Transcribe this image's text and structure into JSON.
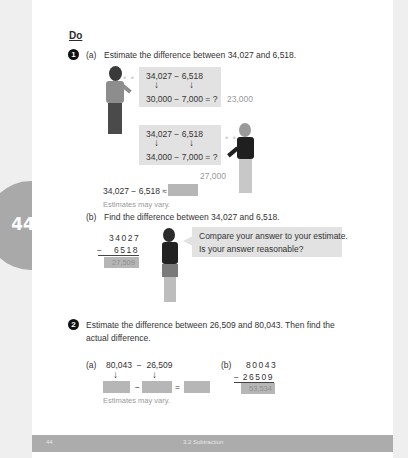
{
  "page": {
    "side_tab_number": "44",
    "heading": "Do",
    "footer": {
      "page_number": "44",
      "section": "3.2 Subtraction"
    }
  },
  "q1": {
    "number": "1",
    "a": {
      "label": "(a)",
      "prompt": "Estimate the difference between 34,027 and 6,518.",
      "boy": {
        "line1": "34,027 − 6,518",
        "arrows": [
          "↓",
          "↓"
        ],
        "line2": "30,000 − 7,000 = ?",
        "answer": "23,000"
      },
      "girl": {
        "line1": "34,027 − 6,518",
        "arrows": [
          "↓",
          "↓"
        ],
        "line2": "34,000 − 7,000 = ?",
        "answer": "27,000"
      },
      "estimate_line": "34,027 − 6,518 ≈",
      "note": "Estimates may vary."
    },
    "b": {
      "label": "(b)",
      "prompt": "Find the difference between 34,027 and 6,518.",
      "top": "34027",
      "minus": "−",
      "bottom": "6518",
      "result": "27,509",
      "speech": [
        "Compare your answer to your estimate.",
        "Is your answer reasonable?"
      ]
    }
  },
  "q2": {
    "number": "2",
    "prompt_line1": "Estimate the difference between 26,509 and 80,043. Then find the",
    "prompt_line2": "actual difference.",
    "a": {
      "label": "(a)",
      "expr": "80,043  −  26,509",
      "arrows": [
        "↓",
        "↓"
      ],
      "minus": "−",
      "equals": "=",
      "note": "Estimates may vary."
    },
    "b": {
      "label": "(b)",
      "top": "80043",
      "minus": "−",
      "bottom": "26509",
      "result": "53,534"
    }
  },
  "colors": {
    "box": "#e2e2e2",
    "answer_box": "#b6b6b6",
    "side_tab": "#a9a9a9",
    "footer": "#acacac"
  }
}
